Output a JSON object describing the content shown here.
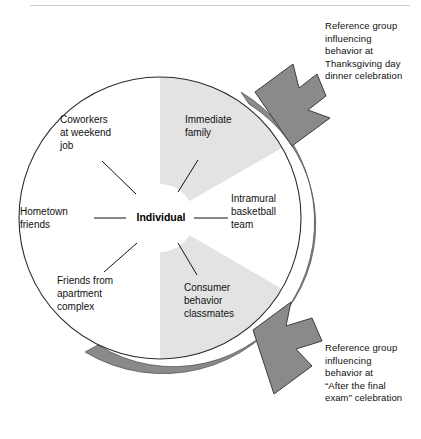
{
  "figure": {
    "center_label": "Individual",
    "nodes": [
      {
        "id": "coworkers",
        "label": "Coworkers\nat weekend\njob"
      },
      {
        "id": "immediate",
        "label": "Immediate\nfamily"
      },
      {
        "id": "hometown",
        "label": "Hometown\nfriends"
      },
      {
        "id": "intramural",
        "label": "Intramural\nbasketball\nteam"
      },
      {
        "id": "friends-apt",
        "label": "Friends from\napartment\ncomplex"
      },
      {
        "id": "consumer",
        "label": "Consumer\nbehavior\nclassmates"
      }
    ],
    "captions": [
      {
        "id": "thanksgiving",
        "text": "Reference group\ninfluencing\nbehavior at\nThanksgiving day\ndinner celebration"
      },
      {
        "id": "final-exam",
        "text": "Reference group\ninfluencing\nbehavior at\n“After the final\nexam” celebration"
      }
    ],
    "colors": {
      "highlight_sector": "#e3e3e3",
      "arc_band": "#8a8a8a",
      "arrow": "#8a8a8a",
      "outline": "#2b2b2b",
      "text": "#111111",
      "rule": "#c9c9c9",
      "background": "#ffffff"
    }
  }
}
